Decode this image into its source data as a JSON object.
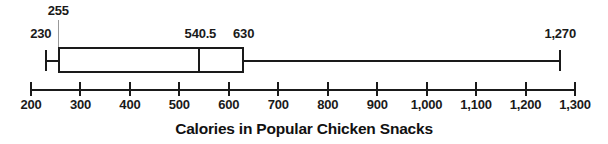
{
  "chart_data": {
    "type": "boxplot",
    "orientation": "horizontal",
    "title": "Calories in Popular Chicken Snacks",
    "stats": {
      "min": 230,
      "q1": 255,
      "median": 540.5,
      "q3": 630,
      "max": 1270
    },
    "point_labels": {
      "min": "230",
      "q1": "255",
      "median": "540.5",
      "q3": "630",
      "max": "1,270"
    },
    "axis": {
      "range": [
        200,
        1300
      ],
      "tick_step": 100,
      "ticks": [
        {
          "value": 200,
          "label": "200"
        },
        {
          "value": 300,
          "label": "300"
        },
        {
          "value": 400,
          "label": "400"
        },
        {
          "value": 500,
          "label": "500"
        },
        {
          "value": 600,
          "label": "600"
        },
        {
          "value": 700,
          "label": "700"
        },
        {
          "value": 800,
          "label": "800"
        },
        {
          "value": 900,
          "label": "900"
        },
        {
          "value": 1000,
          "label": "1,000"
        },
        {
          "value": 1100,
          "label": "1,100"
        },
        {
          "value": 1200,
          "label": "1,200"
        },
        {
          "value": 1300,
          "label": "1,300"
        }
      ]
    },
    "colors": {
      "ink": "#1a1a1a",
      "leader_line": "#999999",
      "background": "#ffffff"
    }
  }
}
